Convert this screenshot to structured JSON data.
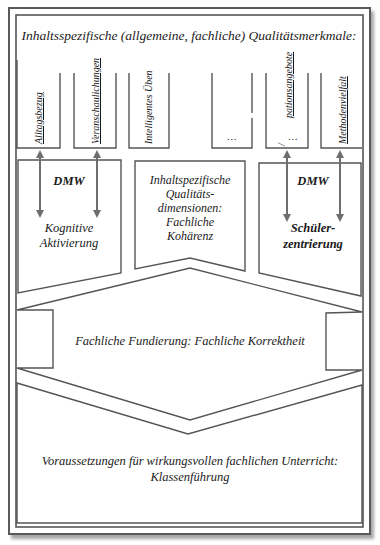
{
  "header": {
    "title": "Inhaltsspezifische (allgemeine, fachliche) Qualitätsmerkmale:"
  },
  "columns": [
    {
      "label": "Alltagsbezug",
      "underlined": true
    },
    {
      "label": "Veranschaulichungen",
      "underlined": true
    },
    {
      "label": "Intelligentes Üben",
      "underlined": false
    },
    {
      "label": "…",
      "underlined": false
    },
    {
      "label": "Partizipationsangebote",
      "visible_fragment": "pationsangebote",
      "ellipsis": "…",
      "underlined": true
    },
    {
      "label": "Methodenvielfalt",
      "underlined": true
    }
  ],
  "dimensions": {
    "left": {
      "tag": "DMW",
      "line1": "Kognitive",
      "line2": "Aktivierung"
    },
    "center": {
      "line1": "Inhaltspezifische",
      "line2": "Qualitäts-",
      "line3": "dimensionen:",
      "line4": "Fachliche",
      "line5": "Kohärenz"
    },
    "right": {
      "tag": "DMW",
      "line1": "Schüler-",
      "line2": "zentrierung"
    }
  },
  "foundation": {
    "label": "Fachliche Fundierung: Fachliche Korrektheit"
  },
  "prerequisites": {
    "line1": "Voraussetzungen für wirkungsvollen fachlichen Unterricht:",
    "line2": "Klassenführung"
  },
  "colors": {
    "line": "#555555",
    "arrow": "#6e6e6e",
    "text": "#1a1a1a"
  }
}
